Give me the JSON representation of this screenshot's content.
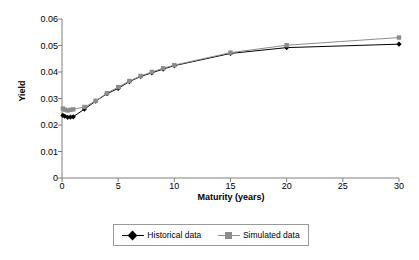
{
  "chart_data": {
    "type": "line",
    "title": "",
    "xlabel": "Maturity (years)",
    "ylabel": "Yield",
    "xlim": [
      0,
      30
    ],
    "ylim": [
      0,
      0.06
    ],
    "xticks": [
      "0",
      "5",
      "10",
      "15",
      "20",
      "25",
      "30"
    ],
    "xtick_values": [
      0,
      5,
      10,
      15,
      20,
      25,
      30
    ],
    "yticks": [
      "0",
      "0.01",
      "0.02",
      "0.03",
      "0.04",
      "0.05",
      "0.06"
    ],
    "ytick_values": [
      0,
      0.01,
      0.02,
      0.03,
      0.04,
      0.05,
      0.06
    ],
    "grid": false,
    "legend_position": "bottom",
    "x": [
      0.08,
      0.25,
      0.5,
      0.75,
      1,
      2,
      3,
      4,
      5,
      6,
      7,
      8,
      9,
      10,
      15,
      20,
      30
    ],
    "series": [
      {
        "name": "Historical data",
        "color": "#000000",
        "marker": "diamond",
        "values": [
          0.0236,
          0.0233,
          0.0229,
          0.023,
          0.0231,
          0.026,
          0.029,
          0.0318,
          0.0338,
          0.0364,
          0.0383,
          0.0397,
          0.0411,
          0.0424,
          0.047,
          0.0492,
          0.0505
        ]
      },
      {
        "name": "Simulated data",
        "color": "#8c8c8c",
        "marker": "square",
        "values": [
          0.0262,
          0.0258,
          0.0255,
          0.0257,
          0.0259,
          0.0268,
          0.0291,
          0.032,
          0.0343,
          0.0366,
          0.0385,
          0.04,
          0.0414,
          0.0426,
          0.0473,
          0.0501,
          0.053
        ]
      }
    ]
  },
  "legend": {
    "entries": [
      {
        "label": "Historical data"
      },
      {
        "label": "Simulated data"
      }
    ]
  }
}
